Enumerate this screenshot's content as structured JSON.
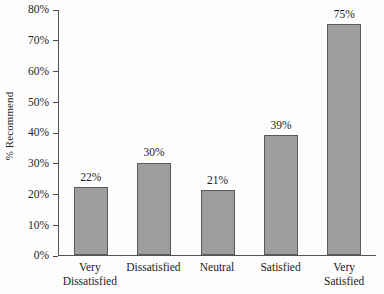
{
  "chart_data": {
    "type": "bar",
    "title": "",
    "xlabel": "",
    "ylabel": "% Recommend",
    "categories": [
      "Very Dissatisfied",
      "Dissatisfied",
      "Neutral",
      "Satisfied",
      "Very Satisfied"
    ],
    "category_lines": [
      [
        "Very",
        "Dissatisfied"
      ],
      [
        "Dissatisfied"
      ],
      [
        "Neutral"
      ],
      [
        "Satisfied"
      ],
      [
        "Very",
        "Satisfied"
      ]
    ],
    "values": [
      22,
      30,
      21,
      39,
      75
    ],
    "value_labels": [
      "22%",
      "30%",
      "21%",
      "39%",
      "75%"
    ],
    "ylim": [
      0,
      80
    ],
    "ytick_values": [
      0,
      10,
      20,
      30,
      40,
      50,
      60,
      70,
      80
    ],
    "ytick_labels": [
      "0%",
      "10%",
      "20%",
      "30%",
      "40%",
      "50%",
      "60%",
      "70%",
      "80%"
    ],
    "grid": false,
    "legend": false,
    "bar_color": "#9e9e9e",
    "bar_border_color": "#5a5a5a",
    "axis_color": "#555555",
    "text_color": "#1c1c1c",
    "background_color": "#fdfdfd"
  }
}
